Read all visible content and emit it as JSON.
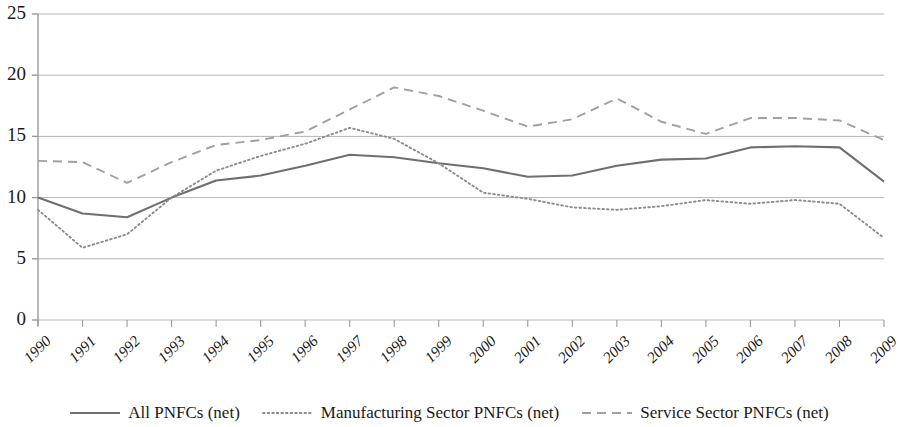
{
  "chart_data": {
    "type": "line",
    "title": "",
    "subtitle": "",
    "xlabel": "",
    "ylabel": "",
    "xlim": [
      1990,
      2009
    ],
    "ylim": [
      0,
      25
    ],
    "ytick_step": 5,
    "yticks": [
      0,
      5,
      10,
      15,
      20,
      25
    ],
    "grid": true,
    "legend_position": "bottom",
    "categories": [
      "1990",
      "1991",
      "1992",
      "1993",
      "1994",
      "1995",
      "1996",
      "1997",
      "1998",
      "1999",
      "2000",
      "2001",
      "2002",
      "2003",
      "2004",
      "2005",
      "2006",
      "2007",
      "2008",
      "2009"
    ],
    "series": [
      {
        "name": "All PNFCs (net)",
        "style": "solid",
        "color": "#6f6f6f",
        "values": [
          10.0,
          8.7,
          8.4,
          10.0,
          11.4,
          11.8,
          12.6,
          13.5,
          13.3,
          12.8,
          12.4,
          11.7,
          11.8,
          12.6,
          13.1,
          13.2,
          14.1,
          14.2,
          14.1,
          11.3
        ]
      },
      {
        "name": "Manufacturing Sector PNFCs (net)",
        "style": "dotted",
        "color": "#8c8c8c",
        "values": [
          9.0,
          5.9,
          7.0,
          10.0,
          12.2,
          13.4,
          14.4,
          15.7,
          14.8,
          12.8,
          10.4,
          9.9,
          9.2,
          9.0,
          9.3,
          9.8,
          9.5,
          9.8,
          9.5,
          6.7
        ]
      },
      {
        "name": "Service Sector PNFCs (net)",
        "style": "dashed",
        "color": "#a0a0a0",
        "values": [
          13.0,
          12.9,
          11.2,
          12.9,
          14.3,
          14.7,
          15.4,
          17.2,
          19.0,
          18.3,
          17.1,
          15.8,
          16.4,
          18.1,
          16.2,
          15.2,
          16.5,
          16.5,
          16.3,
          14.7
        ]
      }
    ]
  },
  "axes": {
    "y_tick_labels": [
      "25",
      "20",
      "15",
      "10",
      "5",
      "0"
    ],
    "x_tick_labels": [
      "1990",
      "1991",
      "1992",
      "1993",
      "1994",
      "1995",
      "1996",
      "1997",
      "1998",
      "1999",
      "2000",
      "2001",
      "2002",
      "2003",
      "2004",
      "2005",
      "2006",
      "2007",
      "2008",
      "2009"
    ]
  },
  "legend": {
    "items": [
      {
        "label": "All PNFCs (net)",
        "style": "solid"
      },
      {
        "label": "Manufacturing Sector PNFCs (net)",
        "style": "dotted"
      },
      {
        "label": "Service Sector PNFCs (net)",
        "style": "dashed"
      }
    ]
  },
  "colors": {
    "grid": "#b5b5b5",
    "axis": "#9a9a9a",
    "text": "#1a1a1a",
    "background": "#ffffff"
  }
}
